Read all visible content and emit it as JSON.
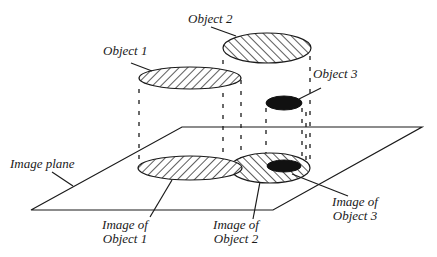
{
  "diagram": {
    "title": "",
    "colors": {
      "stroke": "#1a1a1a",
      "hatch": "#333333",
      "fill_solid": "#111111",
      "background": "#ffffff"
    },
    "labels": {
      "object1": "Object 1",
      "object2": "Object 2",
      "object3": "Object 3",
      "image_plane": "Image plane",
      "image_of_object1": [
        "Image of",
        "Object 1"
      ],
      "image_of_object2": [
        "Image of",
        "Object 2"
      ],
      "image_of_object3": [
        "Image of",
        "Object 3"
      ]
    },
    "objects": [
      {
        "name": "Object 1",
        "fill": "hatch-backslash",
        "cx": 190,
        "cy": 78,
        "rx": 51,
        "ry": 11
      },
      {
        "name": "Object 2",
        "fill": "hatch-slash",
        "cx": 267,
        "cy": 48,
        "rx": 44,
        "ry": 15
      },
      {
        "name": "Object 3",
        "fill": "solid",
        "cx": 284,
        "cy": 103,
        "rx": 18,
        "ry": 7
      }
    ],
    "images": [
      {
        "name": "Image of Object 1",
        "fill": "hatch-backslash",
        "cx": 190,
        "cy": 168,
        "rx": 52,
        "ry": 12
      },
      {
        "name": "Image of Object 2",
        "fill": "hatch-slash",
        "cx": 270,
        "cy": 168,
        "rx": 40,
        "ry": 15
      },
      {
        "name": "Image of Object 3",
        "fill": "solid",
        "cx": 284,
        "cy": 166,
        "rx": 17,
        "ry": 6
      }
    ],
    "image_plane": {
      "points": [
        [
          182,
          127
        ],
        [
          422,
          127
        ],
        [
          273,
          210
        ],
        [
          31,
          210
        ]
      ]
    }
  }
}
